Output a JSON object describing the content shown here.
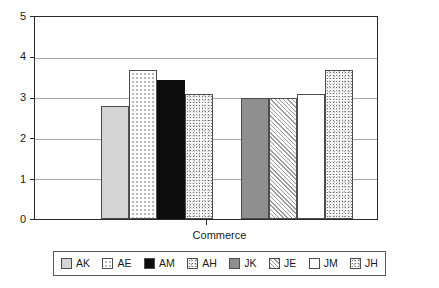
{
  "chart_data": {
    "type": "bar",
    "title": "",
    "subtitle": "",
    "xlabel": "Commerce",
    "ylabel": "",
    "ylim": [
      0,
      5
    ],
    "yticks": [
      "0",
      "1",
      "2",
      "3",
      "4",
      "5"
    ],
    "ytick_values": [
      0,
      1,
      2,
      3,
      4,
      5
    ],
    "grid": true,
    "legend_position": "bottom",
    "categories": [
      "Commerce"
    ],
    "series": [
      {
        "name": "AK",
        "values": [
          2.8
        ],
        "pattern": "light-gray-solid"
      },
      {
        "name": "AE",
        "values": [
          3.7
        ],
        "pattern": "fine-dots"
      },
      {
        "name": "AM",
        "values": [
          3.45
        ],
        "pattern": "black-solid"
      },
      {
        "name": "AH",
        "values": [
          3.1
        ],
        "pattern": "speckle"
      },
      {
        "name": "JK",
        "values": [
          3.0
        ],
        "pattern": "mid-gray-solid"
      },
      {
        "name": "JE",
        "values": [
          3.0
        ],
        "pattern": "diagonal-hatch"
      },
      {
        "name": "JM",
        "values": [
          3.1
        ],
        "pattern": "white-empty"
      },
      {
        "name": "JH",
        "values": [
          3.7
        ],
        "pattern": "speckle"
      }
    ]
  },
  "axis": {
    "y": {
      "ticks": [
        {
          "label": "5",
          "value": 5
        },
        {
          "label": "4",
          "value": 4
        },
        {
          "label": "3",
          "value": 3
        },
        {
          "label": "2",
          "value": 2
        },
        {
          "label": "1",
          "value": 1
        },
        {
          "label": "0",
          "value": 0
        }
      ]
    },
    "x": {
      "label": "Commerce"
    }
  },
  "legend": {
    "items": [
      {
        "label": "AK",
        "pattern": "light-gray-solid"
      },
      {
        "label": "AE",
        "pattern": "fine-dots"
      },
      {
        "label": "AM",
        "pattern": "black-solid"
      },
      {
        "label": "AH",
        "pattern": "speckle"
      },
      {
        "label": "JK",
        "pattern": "mid-gray-solid"
      },
      {
        "label": "JE",
        "pattern": "diagonal-hatch"
      },
      {
        "label": "JM",
        "pattern": "white-empty"
      },
      {
        "label": "JH",
        "pattern": "speckle"
      }
    ]
  },
  "colors": {
    "axis": "#2b2b2b",
    "grid": "#a9a9a9",
    "bar_border": "#4d4d4d",
    "light_gray": "#d4d4d4",
    "mid_gray": "#8f8f8f",
    "black": "#0d0d0d",
    "background": "#ffffff"
  }
}
